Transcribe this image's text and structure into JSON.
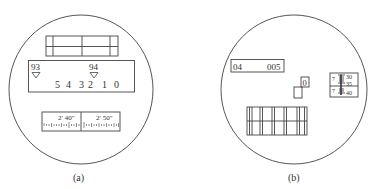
{
  "figure_a": {
    "caption": "(a)",
    "upper_scale": {
      "left_label": "93",
      "right_label": "94",
      "digits": [
        "5",
        "4",
        "3",
        "2",
        "1",
        "0"
      ]
    },
    "lower_scale": {
      "left_label": "2′ 40″",
      "right_label": "2′ 50″"
    }
  },
  "figure_b": {
    "caption": "(b)",
    "reading_window": {
      "left_value": "04",
      "right_value": "005"
    },
    "small_window_value": "0",
    "micrometer": {
      "top_index": "7",
      "bottom_index": "7",
      "ticks": [
        "30",
        "35",
        "40"
      ]
    }
  }
}
